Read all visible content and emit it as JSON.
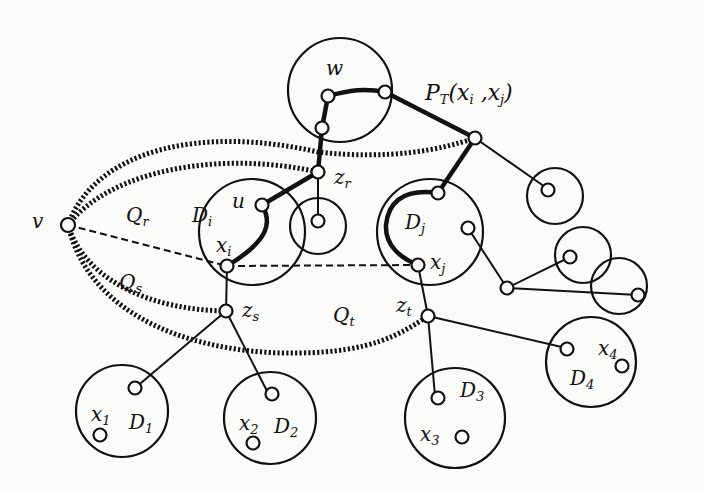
{
  "figure": {
    "type": "graph-diagram",
    "colors": {
      "ink": "#111111",
      "background": "#fbfbf9"
    }
  },
  "labels": {
    "w": "w",
    "path": "P",
    "path_sub": "T",
    "path_args": "(x",
    "path_i": "i",
    "path_comma": " ,x",
    "path_j": "j",
    "path_close": ")",
    "v": "v",
    "u": "u",
    "Qr": "Q",
    "Qr_sub": "r",
    "Qs": "Q",
    "Qs_sub": "s",
    "Qt": "Q",
    "Qt_sub": "t",
    "Di": "D",
    "Di_sub": "i",
    "Dj": "D",
    "Dj_sub": "j",
    "xi": "x",
    "xi_sub": "i",
    "xj": "x",
    "xj_sub": "j",
    "zr": "z",
    "zr_sub": "r",
    "zs": "z",
    "zs_sub": "s",
    "zt": "z",
    "zt_sub": "t",
    "x1": "x",
    "x1_sub": "1",
    "D1": "D",
    "D1_sub": "1",
    "x2": "x",
    "x2_sub": "2",
    "D2": "D",
    "D2_sub": "2",
    "D3": "D",
    "D3_sub": "3",
    "x3": "x",
    "x3_sub": "3",
    "x4": "x",
    "x4_sub": "4",
    "D4": "D",
    "D4_sub": "4"
  }
}
